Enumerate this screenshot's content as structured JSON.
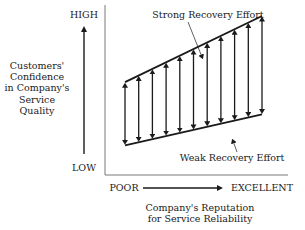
{
  "diagram": {
    "y_axis": {
      "high_label": "HIGH",
      "low_label": "LOW",
      "title_lines": [
        "Customers'",
        "Confidence",
        "in Company's",
        "Service",
        "Quality"
      ]
    },
    "x_axis": {
      "poor_label": "POOR",
      "excellent_label": "EXCELLENT",
      "title_lines": [
        "Company's Reputation",
        "for Service Reliability"
      ]
    },
    "lines": {
      "strong_label": "Strong Recovery Effort",
      "weak_label": "Weak Recovery Effort"
    },
    "strong_line": {
      "start": 0.55,
      "end": 1.0
    },
    "weak_line": {
      "start": 0.12,
      "end": 0.33
    },
    "arrow_count": 11,
    "colors": {
      "ink": "#1a1a1a",
      "rule": "#555555"
    }
  }
}
